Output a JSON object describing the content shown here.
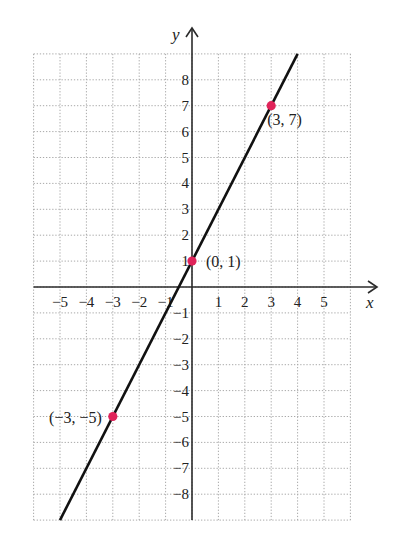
{
  "chart_data": {
    "type": "line",
    "title": "",
    "xlabel": "x",
    "ylabel": "y",
    "xlim": [
      -6,
      6
    ],
    "ylim": [
      -9,
      9
    ],
    "grid": true,
    "grid_style": "dotted",
    "x_ticks": [
      -5,
      -4,
      -3,
      -2,
      -1,
      1,
      2,
      3,
      4,
      5
    ],
    "x_tick_labels": [
      "−5",
      "−4",
      "−3",
      "−2",
      "−1",
      "1",
      "2",
      "3",
      "4",
      "5"
    ],
    "y_ticks": [
      8,
      7,
      6,
      5,
      4,
      3,
      2,
      1,
      -1,
      -2,
      -3,
      -4,
      -5,
      -6,
      -7,
      -8
    ],
    "y_tick_labels": [
      "8",
      "7",
      "6",
      "5",
      "4",
      "3",
      "2",
      "1",
      "−1",
      "−2",
      "−3",
      "−4",
      "−5",
      "−6",
      "−7",
      "−8"
    ],
    "series": [
      {
        "name": "y = 2x + 1",
        "x": [
          -5,
          4
        ],
        "y": [
          -9,
          9
        ],
        "color": "#111111"
      }
    ],
    "points": [
      {
        "x": 3,
        "y": 7,
        "label": "(3, 7)",
        "color": "#e0245a"
      },
      {
        "x": 0,
        "y": 1,
        "label": "(0, 1)",
        "color": "#e0245a"
      },
      {
        "x": -3,
        "y": -5,
        "label": "(−3, −5)",
        "color": "#e0245a"
      }
    ]
  },
  "axes": {
    "x_label": "x",
    "y_label": "y"
  }
}
